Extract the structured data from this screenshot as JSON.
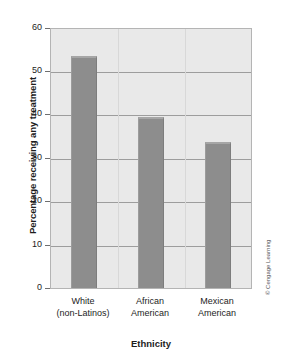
{
  "chart_data": {
    "type": "bar",
    "title": "",
    "subtitle": "",
    "xlabel": "Ethnicity",
    "ylabel": "Percentage receiving any treatment",
    "categories": [
      "White\n(non-Latinos)",
      "African\nAmerican",
      "Mexican\nAmerican"
    ],
    "category_lines": [
      [
        "White",
        "(non-Latinos)"
      ],
      [
        "African",
        "American"
      ],
      [
        "Mexican",
        "American"
      ]
    ],
    "values": [
      53.7,
      39.7,
      33.8
    ],
    "ylim": [
      0,
      60
    ],
    "yticks": [
      0,
      10,
      20,
      30,
      40,
      50,
      60
    ],
    "ytick_labels": [
      "0",
      "10",
      "20",
      "30",
      "40",
      "50",
      "60"
    ],
    "grid": true,
    "legend": false,
    "bar_color": "#8d8d8d",
    "plot_background": "#e9e9e9",
    "gridline_color": "#9d9d9d"
  },
  "credit": {
    "text": "© Cengage Learning"
  }
}
